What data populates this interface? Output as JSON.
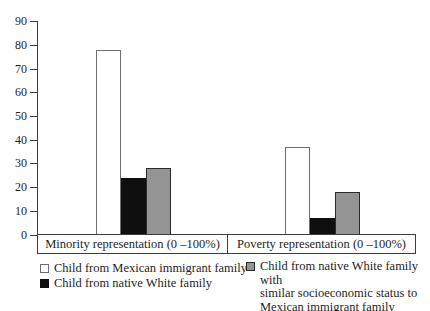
{
  "chart_data": {
    "type": "bar",
    "title": "",
    "xlabel": "",
    "ylabel": "",
    "categories": [
      "Minority representation (0 –100%)",
      "Poverty representation (0 –100%)"
    ],
    "series": [
      {
        "name": "Child from Mexican immigrant family",
        "values": [
          78,
          37
        ],
        "fill": "#ffffff",
        "border": "#6f6f6f"
      },
      {
        "name": "Child from native White family",
        "values": [
          24,
          7
        ],
        "fill": "#0f0f0f",
        "border": "#0f0f0f"
      },
      {
        "name": "Child from native White family with similar socioeconomic status to Mexican immigrant family",
        "values": [
          28,
          18
        ],
        "fill": "#949494",
        "border": "#2b2b2b"
      }
    ],
    "ylim": [
      0,
      90
    ],
    "yticks": [
      0,
      10,
      20,
      30,
      40,
      50,
      60,
      70,
      80,
      90
    ],
    "grid": false,
    "legend_position": "bottom"
  },
  "legend": {
    "left": [
      {
        "label": "Child from Mexican immigrant family",
        "series_index": 0
      },
      {
        "label": "Child from native White family",
        "series_index": 1
      }
    ],
    "right": {
      "series_index": 2,
      "lines": [
        "Child from native White family with",
        "similar socioeconomic status to",
        "Mexican immigrant family"
      ]
    }
  },
  "colors": {
    "axis": "#3c3c3c",
    "text": "#1e1e1e",
    "background": "#ffffff"
  }
}
